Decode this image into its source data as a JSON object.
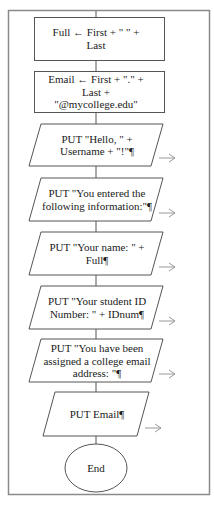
{
  "flowchart": {
    "nodes": [
      {
        "id": "assign-full",
        "type": "process",
        "lines": [
          "Full ← First  +  \" \"  +",
          "Last"
        ]
      },
      {
        "id": "assign-email",
        "type": "process",
        "lines": [
          "Email ← First  +  \".\"  +",
          "Last  +",
          "\"@mycollege.edu\""
        ]
      },
      {
        "id": "put-hello",
        "type": "output",
        "lines": [
          "PUT \"Hello, \" +",
          "Username + \"!\"¶"
        ]
      },
      {
        "id": "put-entered",
        "type": "output",
        "lines": [
          "PUT \"You entered the",
          "following information:\"¶"
        ]
      },
      {
        "id": "put-name",
        "type": "output",
        "lines": [
          "PUT \"Your name: \" +",
          "Full¶"
        ]
      },
      {
        "id": "put-student-id",
        "type": "output",
        "lines": [
          "PUT \"Your student ID",
          "Number: \" + IDnum¶"
        ]
      },
      {
        "id": "put-assigned",
        "type": "output",
        "lines": [
          "PUT \"You have been",
          "assigned a college email",
          "address: \"¶"
        ]
      },
      {
        "id": "put-email",
        "type": "output",
        "lines": [
          "PUT Email¶"
        ]
      },
      {
        "id": "end",
        "type": "terminal",
        "lines": [
          "End"
        ]
      }
    ],
    "colors": {
      "stroke": "#555555",
      "frame": "#888888",
      "text": "#1a1a1a",
      "arrow": "#999999"
    }
  }
}
